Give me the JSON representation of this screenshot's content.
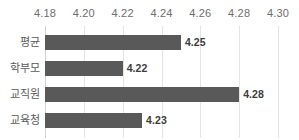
{
  "chart_data": {
    "type": "bar",
    "orientation": "horizontal",
    "title": "",
    "subtitle": "",
    "xlabel": "",
    "ylabel": "",
    "categories": [
      "평균",
      "학부모",
      "교직원",
      "교육청"
    ],
    "values": [
      4.25,
      4.22,
      4.28,
      4.23
    ],
    "data_labels": [
      "4.25",
      "4.22",
      "4.28",
      "4.23"
    ],
    "xlim": [
      4.18,
      4.3
    ],
    "xticks": [
      4.18,
      4.2,
      4.22,
      4.24,
      4.26,
      4.28,
      4.3
    ],
    "xtick_labels": [
      "4.18",
      "4.20",
      "4.22",
      "4.24",
      "4.26",
      "4.28",
      "4.30"
    ],
    "xaxis_position": "top",
    "grid": true,
    "grid_axis": "x",
    "legend": false,
    "bar_color": "#595959",
    "grid_color": "#e4e4e4",
    "axis_color": "#d2d2d2",
    "tick_label_color": "#6d6d6d",
    "category_label_color": "#5b5b5b",
    "data_label_color": "#3c3c3c",
    "background": "#ffffff"
  }
}
